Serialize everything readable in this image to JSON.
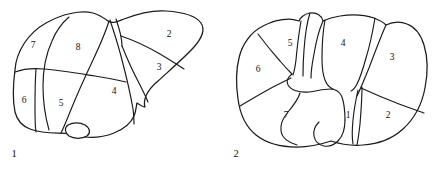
{
  "figure": {
    "background_color": "#ffffff",
    "line_color": "#1a1a1a",
    "panels": [
      {
        "id": "panel-left",
        "caption": "1",
        "caption_position": {
          "x": 14,
          "y": 155
        },
        "view": "anterior view of liver with Couinaud segments",
        "segment_labels": [
          {
            "text": "7",
            "x": 33,
            "y": 46
          },
          {
            "text": "8",
            "x": 78,
            "y": 48
          },
          {
            "text": "2",
            "x": 169,
            "y": 35
          },
          {
            "text": "3",
            "x": 159,
            "y": 68
          },
          {
            "text": "6",
            "x": 24,
            "y": 101
          },
          {
            "text": "5",
            "x": 61,
            "y": 104
          },
          {
            "text": "4",
            "x": 114,
            "y": 92
          }
        ]
      },
      {
        "id": "panel-right",
        "caption": "2",
        "caption_position": {
          "x": 236,
          "y": 155
        },
        "view": "inferior/visceral view of liver with Couinaud segments",
        "segment_labels": [
          {
            "text": "5",
            "x": 290,
            "y": 44
          },
          {
            "text": "4",
            "x": 343,
            "y": 44
          },
          {
            "text": "3",
            "x": 392,
            "y": 58
          },
          {
            "text": "6",
            "x": 258,
            "y": 70
          },
          {
            "text": "7",
            "x": 286,
            "y": 116
          },
          {
            "text": "1",
            "x": 348,
            "y": 116
          },
          {
            "text": "2",
            "x": 388,
            "y": 116
          }
        ]
      }
    ]
  }
}
